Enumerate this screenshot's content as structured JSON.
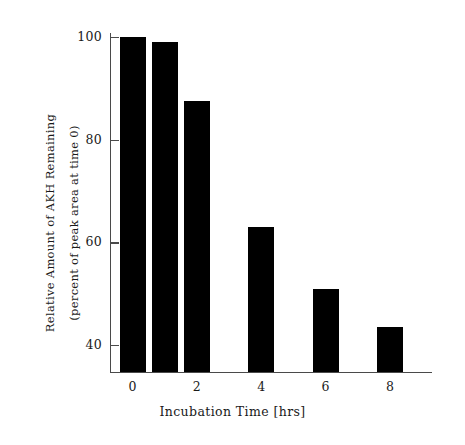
{
  "chart_data": {
    "type": "bar",
    "title": "",
    "xlabel": "Incubation Time [hrs]",
    "ylabel_line1": "Relative Amount of AKH Remaining",
    "ylabel_line2": "(percent of peak area at time 0)",
    "categories": [
      "0",
      "1",
      "2",
      "4",
      "6",
      "8"
    ],
    "x": [
      0,
      1,
      2,
      4,
      6,
      8
    ],
    "values": [
      100,
      99,
      87.5,
      63,
      51,
      43.5
    ],
    "xlim": [
      -0.7,
      9.3
    ],
    "ylim": [
      34.5,
      102
    ],
    "xticks": [
      0,
      2,
      4,
      6,
      8
    ],
    "xtick_labels": [
      "0",
      "2",
      "4",
      "6",
      "8"
    ],
    "yticks": [
      40,
      60,
      80,
      100
    ],
    "ytick_labels": [
      "40",
      "60",
      "80",
      "100"
    ],
    "grid": false,
    "legend": null,
    "bar_color": "#000000",
    "axis_color": "#4a4a4a",
    "background": "#ffffff"
  }
}
